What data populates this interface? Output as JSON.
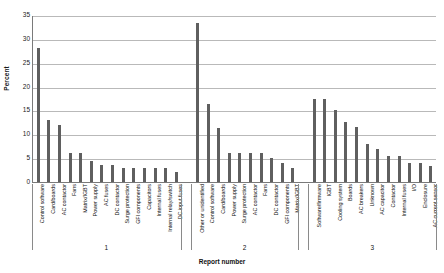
{
  "chart_data": {
    "type": "bar",
    "title": "",
    "xlabel": "Report number",
    "ylabel": "Percent",
    "ylim": [
      0,
      35
    ],
    "yticks": [
      0,
      5,
      10,
      15,
      20,
      25,
      30,
      35
    ],
    "grid": true,
    "legend": "none",
    "bar_color": "#5f5f5f",
    "groups": [
      {
        "name": "1",
        "categories": [
          "Control software",
          "Card/boards",
          "AC contactor",
          "Fans",
          "Matrix/IGBT",
          "Power supply",
          "AC fuses",
          "DC contactor",
          "Surge protection",
          "GFI components",
          "Capacitors",
          "Internal fuses",
          "Internal relay/switch",
          "DC input fuses"
        ],
        "values": [
          28,
          13,
          12,
          6,
          6,
          4.5,
          3.5,
          3.5,
          3,
          3,
          3,
          3,
          3,
          2
        ]
      },
      {
        "name": "2",
        "categories": [
          "Other or unidentified",
          "Control software",
          "Card/boards",
          "Power supply",
          "Surge protection",
          "AC contactor",
          "Fans",
          "DC contactor",
          "GFI components",
          "Matrix/IGBT"
        ],
        "values": [
          33.3,
          16.3,
          11.3,
          6,
          6,
          6,
          6,
          5,
          4,
          3
        ]
      },
      {
        "name": "3",
        "categories": [
          "Software/firmware",
          "IGBT",
          "Cooling system",
          "Boards",
          "AC breakers",
          "Unknown",
          "AC capacitor",
          "Contactor",
          "Internal fuses",
          "I/O",
          "Enclosure",
          "AC current sensor"
        ],
        "values": [
          17.5,
          17.5,
          15,
          12.5,
          11.5,
          8,
          7,
          5.5,
          5.5,
          4,
          4,
          3.3
        ]
      }
    ]
  }
}
